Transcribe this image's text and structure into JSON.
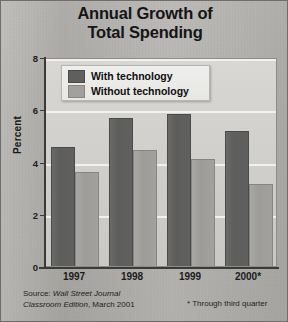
{
  "title": {
    "line1": "Annual Growth of",
    "line2": "Total Spending"
  },
  "legend": {
    "items": [
      {
        "label": "With technology",
        "color": "#5f5f5d"
      },
      {
        "label": "Without technology",
        "color": "#a2a19d"
      }
    ]
  },
  "axes": {
    "ylabel": "Percent",
    "yticks": [
      "0",
      "2",
      "4",
      "6",
      "8"
    ]
  },
  "source": {
    "prefix": "Source: ",
    "italic1": "Wall Street Journal",
    "italic2": "Classroom Edition",
    "suffix": ", March 2001"
  },
  "footnote": "* Through third quarter",
  "chart_data": {
    "type": "bar",
    "title": "Annual Growth of Total Spending",
    "xlabel": "",
    "ylabel": "Percent",
    "ylim": [
      0,
      8
    ],
    "yticks": [
      0,
      2,
      4,
      6,
      8
    ],
    "grid": true,
    "legend_position": "top-left-inside",
    "categories": [
      "1997",
      "1998",
      "1999",
      "2000*"
    ],
    "series": [
      {
        "name": "With technology",
        "color": "#5f5f5d",
        "values": [
          4.55,
          5.65,
          5.8,
          5.15
        ]
      },
      {
        "name": "Without technology",
        "color": "#a2a19d",
        "values": [
          3.6,
          4.45,
          4.1,
          3.15
        ]
      }
    ],
    "annotations": [
      "* Through third quarter"
    ],
    "source": "Source: Wall Street Journal Classroom Edition, March 2001"
  }
}
